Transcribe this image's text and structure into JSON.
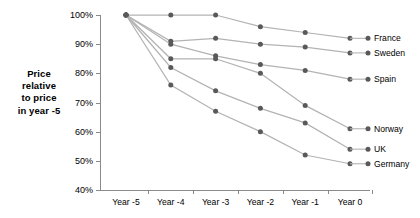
{
  "chart_data": {
    "type": "line",
    "title": "",
    "xlabel": "",
    "ylabel": "Price relative to price in year -5",
    "categories": [
      "Year -5",
      "Year -4",
      "Year -3",
      "Year -2",
      "Year -1",
      "Year 0"
    ],
    "ylim": [
      40,
      100
    ],
    "ytick_labels": [
      "40%",
      "50%",
      "60%",
      "70%",
      "80%",
      "90%",
      "100%"
    ],
    "ytick_values": [
      40,
      50,
      60,
      70,
      80,
      90,
      100
    ],
    "grid": false,
    "legend_position": "right-of-plot-endpoints",
    "value_suffix": "%",
    "series": [
      {
        "name": "France",
        "values": [
          100,
          100,
          100,
          96,
          94,
          92
        ]
      },
      {
        "name": "Sweden",
        "values": [
          100,
          91,
          92,
          90,
          89,
          87
        ]
      },
      {
        "name": "Spain",
        "values": [
          100,
          90,
          86,
          83,
          81,
          78
        ]
      },
      {
        "name": "Norway",
        "values": [
          100,
          85,
          85,
          80,
          69,
          61
        ]
      },
      {
        "name": "UK",
        "values": [
          100,
          82,
          74,
          68,
          63,
          54
        ]
      },
      {
        "name": "Germany",
        "values": [
          100,
          76,
          67,
          60,
          52,
          49
        ]
      }
    ]
  },
  "axis_title": {
    "line1": "Price",
    "line2": "relative",
    "line3": "to price",
    "line4": "in year -5"
  },
  "colors": {
    "line": "#b3b3b3",
    "marker": "#595959",
    "axis": "#8a8a8a",
    "text": "#000000",
    "background": "#ffffff"
  }
}
